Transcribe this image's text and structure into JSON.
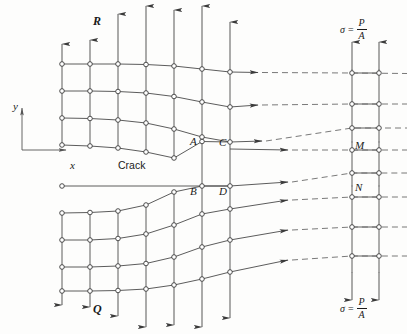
{
  "figure": {
    "type": "finite-element-mesh-crack-diagram",
    "background_color": "#fdfdfc",
    "line_color": "#4a4a4a",
    "node_fill": "#ffffff",
    "node_stroke": "#3a3a3a"
  },
  "labels": {
    "region_upper": "R",
    "region_lower": "Q",
    "crack": "Crack",
    "node_a": "A",
    "node_b": "B",
    "node_c": "C",
    "node_d": "D",
    "node_m": "M",
    "node_n": "N"
  },
  "axes": {
    "y_label": "y",
    "x_label": "x"
  },
  "stress_top": {
    "symbol": "σ",
    "equals": "=",
    "numerator": "P",
    "denominator": "A"
  },
  "stress_bottom": {
    "symbol": "σ",
    "equals": "=",
    "numerator": "P",
    "denominator": "A"
  },
  "mesh": {
    "upper_rows": 4,
    "lower_rows": 4,
    "columns": 7,
    "right_columns": 2,
    "crack_gap": true
  }
}
